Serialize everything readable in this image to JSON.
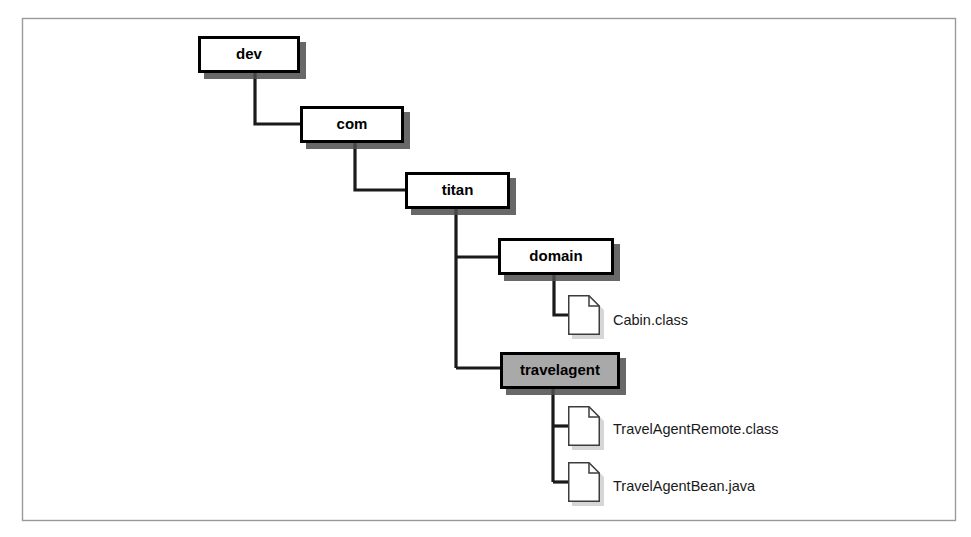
{
  "figure": {
    "kind": "directory-tree-diagram",
    "frame": {
      "border_color": "#9a9a9a",
      "background": "#ffffff",
      "x": 22,
      "y": 18,
      "width": 933,
      "height": 502
    },
    "style": {
      "folder_fill": "#ffffff",
      "folder_highlight_fill": "#a9a9a9",
      "folder_border": "#000000",
      "shadow_color": "#4d4d4d",
      "connector_color": "#1a1a1a",
      "file_fill": "#ffffff",
      "file_border": "#3c3c3c",
      "text_color": "#000000"
    },
    "folders": [
      {
        "id": "dev",
        "label": "dev",
        "highlighted": false,
        "x": 198,
        "y": 36,
        "width": 102,
        "height": 37
      },
      {
        "id": "com",
        "label": "com",
        "highlighted": false,
        "x": 300,
        "y": 106,
        "width": 104,
        "height": 37
      },
      {
        "id": "titan",
        "label": "titan",
        "highlighted": false,
        "x": 405,
        "y": 172,
        "width": 105,
        "height": 37
      },
      {
        "id": "domain",
        "label": "domain",
        "highlighted": false,
        "x": 498,
        "y": 238,
        "width": 116,
        "height": 37
      },
      {
        "id": "travelagent",
        "label": "travelagent",
        "highlighted": true,
        "x": 500,
        "y": 352,
        "width": 120,
        "height": 37
      }
    ],
    "files": [
      {
        "id": "cabin-class",
        "label": "Cabin.class",
        "parent": "domain",
        "icon": "document-icon",
        "x": 568,
        "y": 295,
        "width": 32,
        "height": 40,
        "label_x": 613,
        "label_y": 321
      },
      {
        "id": "travelagentremote-class",
        "label": "TravelAgentRemote.class",
        "parent": "travelagent",
        "icon": "document-icon",
        "x": 568,
        "y": 406,
        "width": 32,
        "height": 40,
        "label_x": 613,
        "label_y": 430
      },
      {
        "id": "travelagentbean-java",
        "label": "TravelAgentBean.java",
        "parent": "travelagent",
        "icon": "document-icon",
        "x": 568,
        "y": 462,
        "width": 32,
        "height": 40,
        "label_x": 613,
        "label_y": 487
      }
    ],
    "connectors": [
      {
        "id": "dev-to-com",
        "from": "dev",
        "to": "com",
        "points": "255,73 255,124 300,124"
      },
      {
        "id": "com-to-titan",
        "from": "com",
        "to": "titan",
        "points": "355,143 355,190 405,190"
      },
      {
        "id": "titan-trunk",
        "from": "titan",
        "to": "children",
        "points": "456,209 456,368"
      },
      {
        "id": "titan-to-domain",
        "from": "titan",
        "to": "domain",
        "points": "456,257 498,257"
      },
      {
        "id": "titan-to-travelagent",
        "from": "titan",
        "to": "travelagent",
        "points": "456,368 500,368"
      },
      {
        "id": "domain-to-cabin",
        "from": "domain",
        "to": "cabin-class",
        "points": "554,275 554,315 568,315"
      },
      {
        "id": "travelagent-trunk",
        "from": "travelagent",
        "to": "children",
        "points": "553,389 553,482"
      },
      {
        "id": "travelagent-to-remote",
        "from": "travelagent",
        "to": "travelagentremote-class",
        "points": "553,426 568,426"
      },
      {
        "id": "travelagent-to-bean",
        "from": "travelagent",
        "to": "travelagentbean-java",
        "points": "553,482 568,482"
      }
    ]
  }
}
